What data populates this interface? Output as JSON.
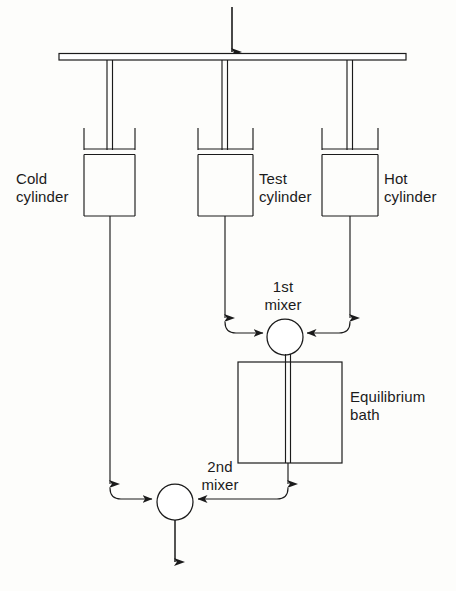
{
  "diagram": {
    "stroke_color": "#1b1b1b",
    "background_color": "#fdfdfb",
    "labels": {
      "cold_cylinder": "Cold\ncylinder",
      "test_cylinder": "Test\ncylinder",
      "hot_cylinder": "Hot\ncylinder",
      "first_mixer": "1st\nmixer",
      "second_mixer": "2nd\nmixer",
      "equilibrium_bath": "Equilibrium\nbath"
    },
    "components": [
      {
        "name": "drive-beam",
        "type": "horizontal-bar",
        "x1": 59,
        "x2": 406,
        "y": 56,
        "thickness": 7
      },
      {
        "name": "input-arrow",
        "type": "arrow",
        "x": 232,
        "y1": 7,
        "y2": 55,
        "direction": "down"
      },
      {
        "name": "cold-cylinder",
        "type": "cylinder",
        "x1": 84,
        "x2": 135,
        "top": 128,
        "piston_y": 150,
        "bottom": 216,
        "rod_x": 110
      },
      {
        "name": "test-cylinder",
        "type": "cylinder",
        "x1": 198,
        "x2": 253,
        "top": 128,
        "piston_y": 150,
        "bottom": 216,
        "rod_x": 225
      },
      {
        "name": "hot-cylinder",
        "type": "cylinder",
        "x1": 322,
        "x2": 378,
        "top": 128,
        "piston_y": 150,
        "bottom": 216,
        "rod_x": 350
      },
      {
        "name": "first-mixer",
        "type": "circle",
        "cx": 285,
        "cy": 337,
        "r": 18
      },
      {
        "name": "second-mixer",
        "type": "circle",
        "cx": 175,
        "cy": 502,
        "r": 18
      },
      {
        "name": "equilibrium-bath",
        "type": "rect",
        "x1": 238,
        "x2": 342,
        "y1": 362,
        "y2": 463
      },
      {
        "name": "bath-internal-pipe",
        "type": "double-line",
        "x": 288,
        "y1": 355,
        "y2": 463
      },
      {
        "name": "output-arrow",
        "type": "arrow",
        "x": 175,
        "y1": 520,
        "y2": 566,
        "direction": "down"
      }
    ],
    "flows": [
      {
        "name": "test-to-first-mixer",
        "from": "test-cylinder",
        "to": "first-mixer",
        "side": "left"
      },
      {
        "name": "hot-to-first-mixer",
        "from": "hot-cylinder",
        "to": "first-mixer",
        "side": "right"
      },
      {
        "name": "first-mixer-to-bath",
        "from": "first-mixer",
        "to": "equilibrium-bath"
      },
      {
        "name": "bath-to-second-mixer",
        "from": "equilibrium-bath",
        "to": "second-mixer",
        "side": "right"
      },
      {
        "name": "cold-to-second-mixer",
        "from": "cold-cylinder",
        "to": "second-mixer",
        "side": "left"
      },
      {
        "name": "second-mixer-outlet",
        "from": "second-mixer",
        "to": "outlet"
      }
    ]
  }
}
